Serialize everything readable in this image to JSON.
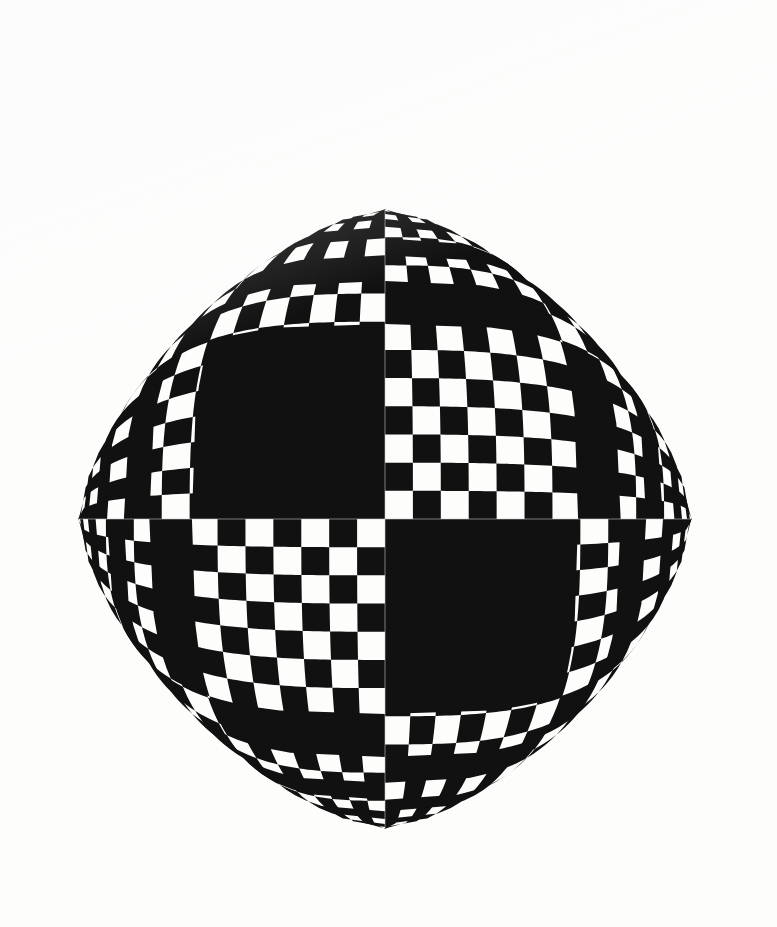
{
  "artwork": {
    "title": "Checkerboard Four-Pointed Star",
    "medium_appearance": "ink on paper",
    "style": "op-art geometric optical illusion",
    "background_color": "#fdfdfc",
    "dark_color": "#111111",
    "light_color": "#fdfdfc",
    "axis_line_color": "#c9c9c9",
    "canvas": {
      "width": 777,
      "height": 927
    }
  },
  "chart_data": {
    "type": "scatter",
    "xlabel": "",
    "ylabel": "",
    "grid": false,
    "legend": "none",
    "geometry": {
      "shape": "astroid",
      "implicit_equation": "|x/a|^(2/3) + |y/b|^(2/3) = 1",
      "center": {
        "x": 385,
        "y": 519
      },
      "semi_axis_x": 307,
      "semi_axis_y": 310,
      "cusp_points": [
        {
          "name": "top-cusp",
          "x": 385,
          "y": 209
        },
        {
          "name": "right-cusp",
          "x": 692,
          "y": 519
        },
        {
          "name": "bottom-cusp",
          "x": 385,
          "y": 829
        },
        {
          "name": "left-cusp",
          "x": 78,
          "y": 519
        }
      ],
      "bounding_box": {
        "x_min": 78,
        "y_min": 209,
        "x_max": 692,
        "y_max": 829
      }
    },
    "tiling": {
      "columns": 22,
      "rows": 22,
      "total_tiles": 484,
      "center_tile_color": "dark",
      "center_tile_size_px": 28,
      "parity_rule": "tile is dark when (col_index + row_index) is even",
      "warp_exponent": 1.5,
      "warp_description": "grid coordinate u in [-1,1] maps to x = a*sign(u)*|u|*(1-|v|^3)^(1/3) scaled so straight rows bow toward the cusps"
    },
    "axes_overlay": {
      "horizontal_axis": {
        "y": 519,
        "x_from": 78,
        "x_to": 692,
        "color": "#c9c9c9"
      },
      "vertical_axis": {
        "x": 385,
        "y_from": 209,
        "y_to": 829,
        "color": "#c9c9c9"
      }
    },
    "measured_samples": {
      "note": "half-width of the pattern measured at several heights above centre",
      "y_offsets_px": [
        0,
        31,
        62,
        93,
        124,
        155,
        186,
        217,
        248,
        279,
        310
      ],
      "half_width_px": [
        307,
        304,
        295,
        280,
        258,
        230,
        196,
        157,
        113,
        61,
        0
      ]
    }
  }
}
